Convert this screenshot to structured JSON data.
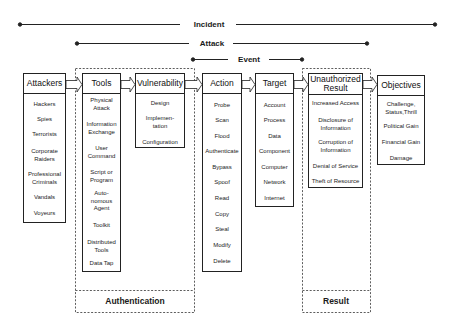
{
  "scope_lines": [
    {
      "label": "Incident"
    },
    {
      "label": "Attack"
    },
    {
      "label": "Event"
    }
  ],
  "columns": [
    {
      "header": "Attackers",
      "items": [
        "Hackers",
        "Spies",
        "Terrorists",
        "Corporate\nRaiders",
        "Professional\nCriminals",
        "Vandals",
        "Voyeurs"
      ]
    },
    {
      "header": "Tools",
      "items": [
        "Physical\nAttack",
        "Information\nExchange",
        "User\nCommand",
        "Script or\nProgram",
        "Auto-\nnomous\nAgent",
        "Toolkit",
        "Distributed\nTools",
        "Data Tap"
      ]
    },
    {
      "header": "Vulnerability",
      "items": [
        "Design",
        "Implemen-\ntation",
        "Configuration"
      ]
    },
    {
      "header": "Action",
      "items": [
        "Probe",
        "Scan",
        "Flood",
        "Authenticate",
        "Bypass",
        "Spoof",
        "Read",
        "Copy",
        "Steal",
        "Modify",
        "Delete"
      ]
    },
    {
      "header": "Target",
      "items": [
        "Account",
        "Process",
        "Data",
        "Component",
        "Computer",
        "Network",
        "Internet"
      ]
    },
    {
      "header": "Unauthorized\nResult",
      "items": [
        "Increased Access",
        "Disclosure of\nInformation",
        "Corruption of\nInformation",
        "Denial of Service",
        "Theft of Resource"
      ]
    },
    {
      "header": "Objectives",
      "items": [
        "Challenge,\nStatus,Thrill",
        "Political Gain",
        "Financial Gain",
        "Damage"
      ]
    }
  ],
  "groups": {
    "authentication": "Authentication",
    "result": "Result"
  }
}
